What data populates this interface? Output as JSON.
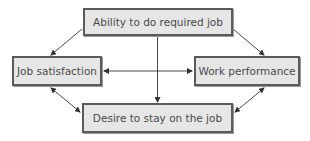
{
  "diagram": {
    "type": "flow-diagram",
    "nodes": {
      "top": {
        "label": "Ability to do required job"
      },
      "left": {
        "label": "Job satisfaction"
      },
      "right": {
        "label": "Work performance"
      },
      "bottom": {
        "label": "Desire to stay on the job"
      }
    },
    "edges": [
      {
        "from": "Ability to do required job",
        "to": "Job satisfaction",
        "direction": "one-way"
      },
      {
        "from": "Ability to do required job",
        "to": "Work performance",
        "direction": "one-way"
      },
      {
        "from": "Ability to do required job",
        "to": "Desire to stay on the job",
        "direction": "one-way"
      },
      {
        "from": "Job satisfaction",
        "to": "Work performance",
        "direction": "two-way"
      },
      {
        "from": "Job satisfaction",
        "to": "Desire to stay on the job",
        "direction": "two-way"
      },
      {
        "from": "Work performance",
        "to": "Desire to stay on the job",
        "direction": "two-way"
      }
    ],
    "colors": {
      "box_fill": "#e6e6e6",
      "box_border": "#5a5a5a",
      "text": "#4a4a4a",
      "arrow": "#333333"
    }
  }
}
